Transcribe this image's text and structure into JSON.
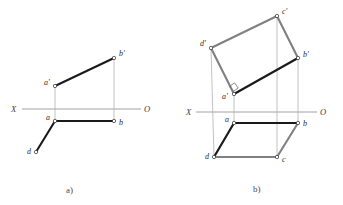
{
  "figure": {
    "background_color": "#ffffff",
    "colors": {
      "solid_segment": "#1a1a1a",
      "outline_segment": "#808080",
      "projection_line": "#b0b0b0",
      "axis_line": "#8c8c8c",
      "label_text": "#2b2b2b",
      "vertex_fill": "#ffffff"
    },
    "panels": [
      {
        "id": "panel-a",
        "caption": "a)",
        "caption_pos": {
          "x": 66,
          "y": 193
        },
        "axis": {
          "left_label": "X",
          "right_label": "O",
          "left_label_pos": {
            "x": 11,
            "y": 112
          },
          "right_label_pos": {
            "x": 144,
            "y": 112
          },
          "y": 109,
          "x1": 22,
          "x2": 141
        },
        "points": [
          {
            "name": "b-prime",
            "label": "b'",
            "x": 114,
            "y": 58,
            "label_dx": 5,
            "label_dy": -2
          },
          {
            "name": "a-prime",
            "label": "a'",
            "x": 55,
            "y": 86,
            "label_dx": -11,
            "label_dy": -1
          },
          {
            "name": "a",
            "label": "a",
            "x": 55,
            "y": 121,
            "label_dx": -9,
            "label_dy": -1
          },
          {
            "name": "b",
            "label": "b",
            "x": 114,
            "y": 121,
            "label_dx": 5,
            "label_dy": 4
          },
          {
            "name": "d",
            "label": "d",
            "x": 36,
            "y": 152,
            "label_dx": -9,
            "label_dy": 2
          }
        ],
        "solid_segments": [
          {
            "name": "segment-a-prime-b-prime",
            "x1": 55,
            "y1": 86,
            "x2": 114,
            "y2": 58
          },
          {
            "name": "segment-a-b",
            "x1": 55,
            "y1": 121,
            "x2": 114,
            "y2": 121
          },
          {
            "name": "segment-a-d",
            "x1": 55,
            "y1": 121,
            "x2": 36,
            "y2": 152
          }
        ],
        "projection_lines": [
          {
            "name": "projector-a",
            "x1": 55,
            "y1": 86,
            "x2": 55,
            "y2": 121
          },
          {
            "name": "projector-b",
            "x1": 114,
            "y1": 58,
            "x2": 114,
            "y2": 121
          }
        ]
      },
      {
        "id": "panel-b",
        "caption": "b)",
        "caption_pos": {
          "x": 253,
          "y": 192
        },
        "axis": {
          "left_label": "X",
          "right_label": "O",
          "left_label_pos": {
            "x": 187,
            "y": 114
          },
          "right_label_pos": {
            "x": 320,
            "y": 114
          },
          "y": 112,
          "x1": 196,
          "x2": 317
        },
        "points": [
          {
            "name": "c-prime",
            "label": "c'",
            "x": 277,
            "y": 16,
            "label_dx": 5,
            "label_dy": -2
          },
          {
            "name": "d-prime",
            "label": "d'",
            "x": 211,
            "y": 48,
            "label_dx": -11,
            "label_dy": -2
          },
          {
            "name": "b-prime",
            "label": "b'",
            "x": 298,
            "y": 58,
            "label_dx": 5,
            "label_dy": -1
          },
          {
            "name": "a-prime",
            "label": "a'",
            "x": 234,
            "y": 94,
            "label_dx": -12,
            "label_dy": 5
          },
          {
            "name": "a",
            "label": "a",
            "x": 234,
            "y": 123,
            "label_dx": -9,
            "label_dy": -1
          },
          {
            "name": "b",
            "label": "b",
            "x": 298,
            "y": 123,
            "label_dx": 5,
            "label_dy": 3
          },
          {
            "name": "d",
            "label": "d",
            "x": 214,
            "y": 157,
            "label_dx": -9,
            "label_dy": 2
          },
          {
            "name": "c",
            "label": "c",
            "x": 277,
            "y": 157,
            "label_dx": 5,
            "label_dy": 5
          }
        ],
        "solid_segments": [
          {
            "name": "segment-a-prime-b-prime",
            "x1": 234,
            "y1": 94,
            "x2": 298,
            "y2": 58
          },
          {
            "name": "segment-a-b",
            "x1": 234,
            "y1": 123,
            "x2": 298,
            "y2": 123
          },
          {
            "name": "segment-a-d",
            "x1": 234,
            "y1": 123,
            "x2": 214,
            "y2": 157
          }
        ],
        "outline_segments": [
          {
            "name": "segment-a-prime-d-prime",
            "x1": 234,
            "y1": 94,
            "x2": 211,
            "y2": 48
          },
          {
            "name": "segment-d-prime-c-prime",
            "x1": 211,
            "y1": 48,
            "x2": 277,
            "y2": 16
          },
          {
            "name": "segment-c-prime-b-prime",
            "x1": 277,
            "y1": 16,
            "x2": 298,
            "y2": 58
          },
          {
            "name": "segment-b-c",
            "x1": 298,
            "y1": 123,
            "x2": 277,
            "y2": 157
          },
          {
            "name": "segment-d-c",
            "x1": 214,
            "y1": 157,
            "x2": 277,
            "y2": 157
          }
        ],
        "projection_lines": [
          {
            "name": "projector-d",
            "x1": 211,
            "y1": 48,
            "x2": 214,
            "y2": 157
          },
          {
            "name": "projector-a",
            "x1": 234,
            "y1": 92,
            "x2": 234,
            "y2": 123
          },
          {
            "name": "projector-c",
            "x1": 277,
            "y1": 16,
            "x2": 277,
            "y2": 157
          },
          {
            "name": "projector-b",
            "x1": 298,
            "y1": 58,
            "x2": 298,
            "y2": 123
          }
        ],
        "right_angle_marker": {
          "name": "right-angle-marker-at-a-prime",
          "points": "229.5,86.5 234.5,82.8 238.2,88.0 233.6,91.2"
        }
      }
    ]
  }
}
